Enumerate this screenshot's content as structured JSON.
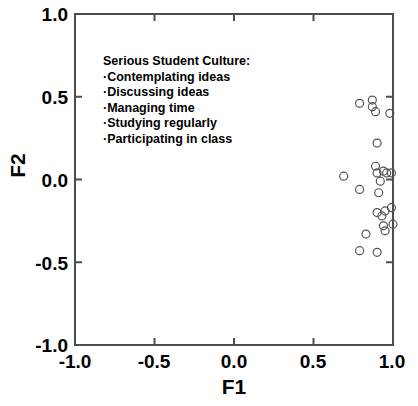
{
  "figure": {
    "background_color": "#ffffff",
    "frame_color": "#4d4d4d",
    "marker_color": "#555555"
  },
  "annotation": {
    "title": "Serious Student Culture:",
    "items": [
      "·Contemplating ideas",
      "·Discussing ideas",
      "·Managing time",
      "·Studying regularly",
      "·Participating in class"
    ]
  },
  "axes": {
    "xlabel": "F1",
    "ylabel": "F2",
    "xticks": [
      "-1.0",
      "-0.5",
      "0.0",
      "0.5",
      "1.0"
    ],
    "yticks": [
      "1.0",
      "0.5",
      "0.0",
      "-0.5",
      "-1.0"
    ]
  },
  "chart_data": {
    "type": "scatter",
    "title": "",
    "xlabel": "F1",
    "ylabel": "F2",
    "xlim": [
      -1.0,
      1.0
    ],
    "ylim": [
      -1.0,
      1.0
    ],
    "xticks": [
      -1.0,
      -0.5,
      0.0,
      0.5,
      1.0
    ],
    "yticks": [
      -1.0,
      -0.5,
      0.0,
      0.5,
      1.0
    ],
    "grid": false,
    "legend": null,
    "marker": "open-circle",
    "annotations": [
      {
        "text": "Serious Student Culture: ·Contemplating ideas ·Discussing ideas ·Managing time ·Studying regularly ·Participating in class",
        "x": -0.82,
        "y": 0.7
      }
    ],
    "series": [
      {
        "name": "items",
        "points": [
          {
            "x": 0.79,
            "y": 0.46
          },
          {
            "x": 0.87,
            "y": 0.48
          },
          {
            "x": 0.87,
            "y": 0.44
          },
          {
            "x": 0.89,
            "y": 0.41
          },
          {
            "x": 0.98,
            "y": 0.4
          },
          {
            "x": 0.9,
            "y": 0.22
          },
          {
            "x": 0.89,
            "y": 0.08
          },
          {
            "x": 0.9,
            "y": 0.04
          },
          {
            "x": 0.94,
            "y": 0.05
          },
          {
            "x": 0.96,
            "y": 0.04
          },
          {
            "x": 0.99,
            "y": 0.04
          },
          {
            "x": 0.69,
            "y": 0.02
          },
          {
            "x": 0.92,
            "y": -0.01
          },
          {
            "x": 0.79,
            "y": -0.06
          },
          {
            "x": 0.91,
            "y": -0.08
          },
          {
            "x": 0.99,
            "y": -0.17
          },
          {
            "x": 0.9,
            "y": -0.2
          },
          {
            "x": 0.95,
            "y": -0.19
          },
          {
            "x": 0.93,
            "y": -0.22
          },
          {
            "x": 1.0,
            "y": -0.27
          },
          {
            "x": 0.94,
            "y": -0.28
          },
          {
            "x": 0.95,
            "y": -0.31
          },
          {
            "x": 0.83,
            "y": -0.33
          },
          {
            "x": 0.79,
            "y": -0.43
          },
          {
            "x": 0.9,
            "y": -0.44
          }
        ]
      }
    ]
  }
}
